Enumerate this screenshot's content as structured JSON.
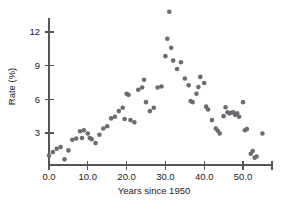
{
  "chart_data": {
    "type": "scatter",
    "title": "",
    "xlabel": "Years since 1950",
    "ylabel": "Rate (%)",
    "xlim": [
      -2.5,
      57.5
    ],
    "ylim": [
      0.0,
      14.6
    ],
    "grid": false,
    "legend": null,
    "xticks": [
      0.0,
      10.0,
      20.0,
      30.0,
      40.0,
      50.0
    ],
    "xticklabels": [
      "0.0",
      "10.0",
      "20.0",
      "30.0",
      "40.0",
      "50.0"
    ],
    "yticks": [
      3,
      6,
      9,
      12
    ],
    "yticklabels": [
      "3",
      "6",
      "9",
      "12"
    ],
    "marker": "circle",
    "marker_color": "#6b6b72",
    "marker_size": 2.3,
    "series": [
      {
        "name": "Rate",
        "x": [
          0,
          1,
          2,
          3,
          4,
          5,
          6,
          7,
          8,
          8.5,
          9,
          10,
          10.5,
          11,
          12,
          13,
          14,
          15,
          16,
          17,
          18,
          19,
          19.5,
          20,
          20.5,
          21,
          22,
          23,
          24,
          24.5,
          25,
          26,
          27,
          28,
          29,
          30,
          30.5,
          31,
          31.5,
          32,
          33,
          34,
          35,
          36,
          36.5,
          37,
          38,
          38.5,
          39,
          40,
          40.5,
          41,
          42,
          43,
          43.5,
          44,
          45,
          45.5,
          46,
          46.5,
          47,
          47.5,
          48,
          48.5,
          49,
          50,
          50.5,
          51,
          52,
          52.5,
          53,
          53.5,
          55
        ],
        "y": [
          1.0,
          1.3,
          1.6,
          1.75,
          0.65,
          1.45,
          2.4,
          2.5,
          3.15,
          2.55,
          3.25,
          2.95,
          2.55,
          2.45,
          2.1,
          2.85,
          3.4,
          3.6,
          4.3,
          4.45,
          4.95,
          5.25,
          4.25,
          6.5,
          6.4,
          4.15,
          3.95,
          6.85,
          7.05,
          7.75,
          5.75,
          4.95,
          5.25,
          7.05,
          7.15,
          9.85,
          11.4,
          13.8,
          10.6,
          9.45,
          8.7,
          9.3,
          7.85,
          7.25,
          5.85,
          5.75,
          6.5,
          7.1,
          8.0,
          7.45,
          5.35,
          5.1,
          4.15,
          3.4,
          3.2,
          2.95,
          4.5,
          5.3,
          4.85,
          4.75,
          4.8,
          4.85,
          4.6,
          4.75,
          4.45,
          5.75,
          3.25,
          3.35,
          1.15,
          1.4,
          0.8,
          0.9,
          2.95
        ]
      }
    ]
  },
  "axes": {
    "x_axis_name": "x-axis",
    "y_axis_name": "y-axis"
  }
}
